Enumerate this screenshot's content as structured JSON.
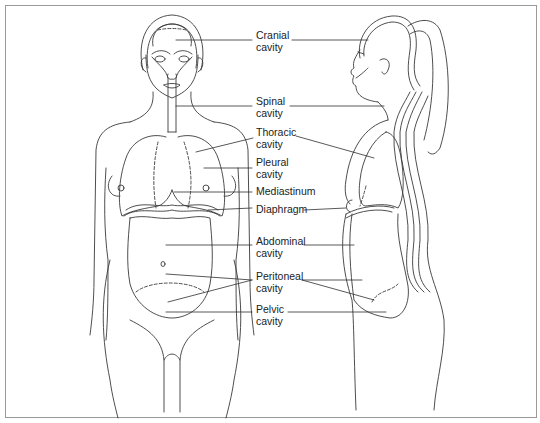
{
  "figure": {
    "views": [
      "front-view",
      "side-view"
    ],
    "colors": {
      "line": "#3a3a3a",
      "border": "#9a9a9a",
      "background": "#ffffff",
      "text": "#222222"
    }
  },
  "labels": [
    {
      "id": "cranial",
      "line1": "Cranial",
      "line2": "cavity"
    },
    {
      "id": "spinal",
      "line1": "Spinal",
      "line2": "cavity"
    },
    {
      "id": "thoracic",
      "line1": "Thoracic",
      "line2": "cavity"
    },
    {
      "id": "pleural",
      "line1": "Pleural",
      "line2": "cavity"
    },
    {
      "id": "mediastinum",
      "line1": "Mediastinum",
      "line2": ""
    },
    {
      "id": "diaphragm",
      "line1": "Diaphragm",
      "line2": ""
    },
    {
      "id": "abdominal",
      "line1": "Abdominal",
      "line2": "cavity"
    },
    {
      "id": "peritoneal",
      "line1": "Peritoneal",
      "line2": "cavity"
    },
    {
      "id": "pelvic",
      "line1": "Pelvic",
      "line2": "cavity"
    }
  ]
}
